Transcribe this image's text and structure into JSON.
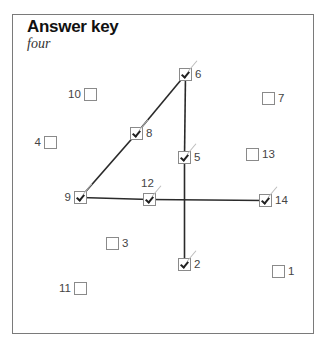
{
  "header": {
    "title": "Answer key",
    "subtitle": "four"
  },
  "items": [
    {
      "id": "1",
      "label": "1",
      "checked": false,
      "x": 272,
      "y": 264,
      "label_side": "right"
    },
    {
      "id": "2",
      "label": "2",
      "checked": true,
      "x": 178,
      "y": 257,
      "label_side": "right"
    },
    {
      "id": "3",
      "label": "3",
      "checked": false,
      "x": 106,
      "y": 236,
      "label_side": "right"
    },
    {
      "id": "4",
      "label": "4",
      "checked": false,
      "x": 44,
      "y": 135,
      "label_side": "left"
    },
    {
      "id": "5",
      "label": "5",
      "checked": true,
      "x": 178,
      "y": 150,
      "label_side": "right"
    },
    {
      "id": "6",
      "label": "6",
      "checked": true,
      "x": 179,
      "y": 67,
      "label_side": "right"
    },
    {
      "id": "7",
      "label": "7",
      "checked": false,
      "x": 262,
      "y": 91,
      "label_side": "right"
    },
    {
      "id": "8",
      "label": "8",
      "checked": true,
      "x": 130,
      "y": 126,
      "label_side": "right"
    },
    {
      "id": "9",
      "label": "9",
      "checked": true,
      "x": 74,
      "y": 190,
      "label_side": "left"
    },
    {
      "id": "10",
      "label": "10",
      "checked": false,
      "x": 84,
      "y": 87,
      "label_side": "left"
    },
    {
      "id": "11",
      "label": "11",
      "checked": false,
      "x": 75,
      "y": 281,
      "label_side": "left"
    },
    {
      "id": "12",
      "label": "12",
      "checked": true,
      "x": 143,
      "y": 192,
      "label_side": "top"
    },
    {
      "id": "13",
      "label": "13",
      "checked": false,
      "x": 246,
      "y": 147,
      "label_side": "right"
    },
    {
      "id": "14",
      "label": "14",
      "checked": true,
      "x": 259,
      "y": 193,
      "label_side": "right"
    }
  ],
  "connections": [
    {
      "from": "6",
      "to": "8"
    },
    {
      "from": "8",
      "to": "9"
    },
    {
      "from": "9",
      "to": "12"
    },
    {
      "from": "12",
      "to": "14"
    },
    {
      "from": "6",
      "to": "5"
    },
    {
      "from": "5",
      "to": "2"
    }
  ],
  "colors": {
    "line": "#2a2a2a",
    "box_border": "#8a8a8a",
    "frame_border": "#7a7a7a",
    "text": "#444444"
  }
}
